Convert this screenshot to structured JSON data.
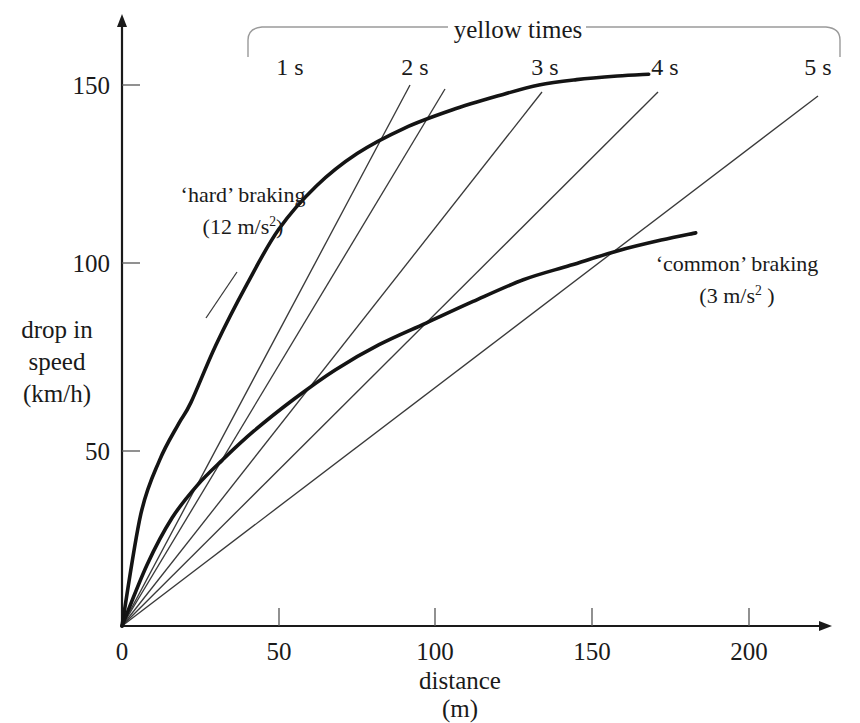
{
  "chart_data": {
    "type": "line",
    "title": "",
    "xlabel": "distance",
    "xunit": "(m)",
    "ylabel_lines": [
      "drop in",
      "speed",
      "(km/h)"
    ],
    "xlim": [
      0,
      215
    ],
    "ylim": [
      0,
      168
    ],
    "xticks": [
      0,
      50,
      100,
      150,
      200
    ],
    "xticklabels": [
      "0",
      "50",
      "100",
      "150",
      "200"
    ],
    "yticks": [
      50,
      100,
      150
    ],
    "yticklabels": [
      "50",
      "100",
      "150"
    ],
    "grid": false,
    "legend_position": "annotations",
    "series": [
      {
        "name": "'hard' braking",
        "note_line1": "‘hard’ braking",
        "note_line2_prefix": "(12 m/s",
        "note_line2_sup": "2",
        "note_line2_suffix": ")",
        "deceleration": "12 m/s^2",
        "style": "thick",
        "points": [
          [
            0,
            0
          ],
          [
            6,
            31
          ],
          [
            12,
            46
          ],
          [
            18,
            56
          ],
          [
            22,
            62
          ],
          [
            30,
            78
          ],
          [
            40,
            95
          ],
          [
            50,
            110
          ],
          [
            62,
            122
          ],
          [
            75,
            131
          ],
          [
            90,
            138
          ],
          [
            105,
            143
          ],
          [
            120,
            147
          ],
          [
            133,
            150
          ],
          [
            145,
            151.5
          ],
          [
            158,
            152.5
          ],
          [
            168,
            153
          ]
        ]
      },
      {
        "name": "'common' braking",
        "note_line1": "‘common’ braking",
        "note_line2_prefix": "(3 m/s",
        "note_line2_sup": "2",
        "note_line2_suffix": " )",
        "deceleration": "3 m/s^2",
        "style": "thick",
        "points": [
          [
            0,
            0
          ],
          [
            8,
            17
          ],
          [
            16,
            30
          ],
          [
            24,
            39
          ],
          [
            32,
            46
          ],
          [
            42,
            54
          ],
          [
            55,
            63
          ],
          [
            68,
            71
          ],
          [
            82,
            78
          ],
          [
            97,
            84
          ],
          [
            112,
            90
          ],
          [
            128,
            96
          ],
          [
            143,
            100
          ],
          [
            158,
            104
          ],
          [
            172,
            107
          ],
          [
            183,
            109
          ]
        ]
      }
    ],
    "yellow_time_lines": [
      {
        "label": "1 s",
        "seconds": 1,
        "end_distance": 92,
        "end_speed": 150,
        "label_x": 290,
        "label_y": 58
      },
      {
        "label": "2 s",
        "seconds": 2,
        "end_distance": 103,
        "end_speed": 149,
        "label_x": 415,
        "label_y": 58
      },
      {
        "label": "3 s",
        "seconds": 3,
        "end_distance": 134,
        "end_speed": 148,
        "label_x": 545,
        "label_y": 58
      },
      {
        "label": "4 s",
        "seconds": 4,
        "end_distance": 171,
        "end_speed": 148,
        "label_x": 665,
        "label_y": 58
      },
      {
        "label": "5 s",
        "seconds": 5,
        "end_distance": 222,
        "end_speed": 147,
        "label_x": 818,
        "label_y": 58
      }
    ],
    "bracket_label": "yellow times"
  },
  "axes": {
    "y_label_line1": "drop in",
    "y_label_line2": "speed",
    "y_label_line3": "(km/h)",
    "x_label": "distance",
    "x_unit": "(m)"
  },
  "annotations": {
    "hard_braking_line1": "‘hard’ braking",
    "hard_braking_line2_pre": "(12 m/s",
    "hard_braking_line2_sup": "2",
    "hard_braking_line2_post": ")",
    "common_braking_line1": "‘common’ braking",
    "common_braking_line2_pre": "(3 m/s",
    "common_braking_line2_sup": "2",
    "common_braking_line2_post": " )",
    "bracket_title": "yellow times"
  },
  "colors": {
    "ink": "#1a1a1a",
    "thin_line": "#3a3a3a",
    "bracket": "#8a8a8a",
    "background": "#ffffff"
  }
}
